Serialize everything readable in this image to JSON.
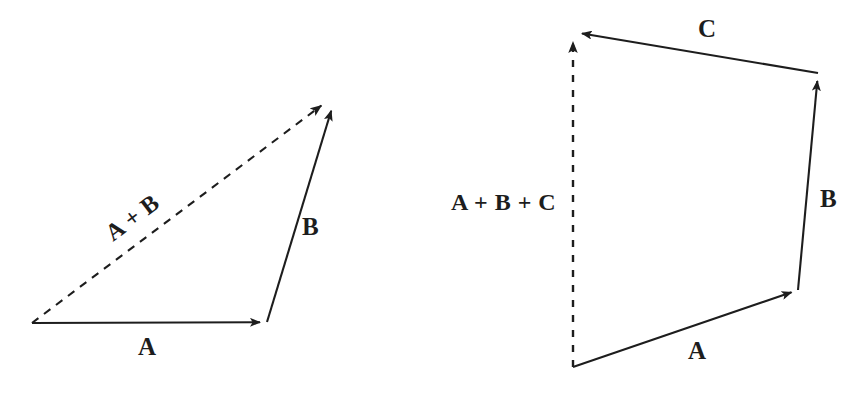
{
  "figure": {
    "background_color": "#ffffff",
    "stroke_color": "#1d1d1d",
    "canvas": {
      "width": 852,
      "height": 393
    }
  },
  "diagrams": [
    {
      "id": "triangle-rule",
      "name": "Triangle rule: A + B",
      "vectors": [
        {
          "name": "A",
          "label": "A",
          "style": "solid",
          "from": [
            32,
            323
          ],
          "to": [
            267,
            322
          ],
          "label_pos": [
            138,
            334
          ],
          "rotation": 0
        },
        {
          "name": "B",
          "label": "B",
          "style": "solid",
          "from": [
            267,
            322
          ],
          "to": [
            333,
            104
          ],
          "label_pos": [
            302,
            214
          ],
          "rotation": 0
        },
        {
          "name": "A+B",
          "label": "A + B",
          "style": "dashed",
          "from": [
            32,
            323
          ],
          "to": [
            330,
            99
          ],
          "label_pos": [
            101,
            226
          ],
          "rotation": -37
        }
      ]
    },
    {
      "id": "polygon-rule",
      "name": "Polygon rule: A + B + C",
      "vectors": [
        {
          "name": "A",
          "label": "A",
          "style": "solid",
          "from": [
            573,
            367
          ],
          "to": [
            798,
            290
          ],
          "label_pos": [
            688,
            338
          ],
          "rotation": 0
        },
        {
          "name": "B",
          "label": "B",
          "style": "solid",
          "from": [
            798,
            290
          ],
          "to": [
            818,
            73
          ],
          "label_pos": [
            820,
            186
          ],
          "rotation": 0
        },
        {
          "name": "C",
          "label": "C",
          "style": "solid",
          "from": [
            818,
            73
          ],
          "to": [
            573,
            32
          ],
          "label_pos": [
            698,
            16
          ],
          "rotation": 0
        },
        {
          "name": "A+B+C",
          "label": "A + B + C",
          "style": "dashed",
          "from": [
            573,
            367
          ],
          "to": [
            573,
            32
          ],
          "label_pos": [
            451,
            190
          ],
          "rotation": 0
        }
      ]
    }
  ],
  "labels": {
    "left_a": "A",
    "left_b": "B",
    "left_sum": "A + B",
    "right_a": "A",
    "right_b": "B",
    "right_c": "C",
    "right_sum": "A + B + C"
  }
}
